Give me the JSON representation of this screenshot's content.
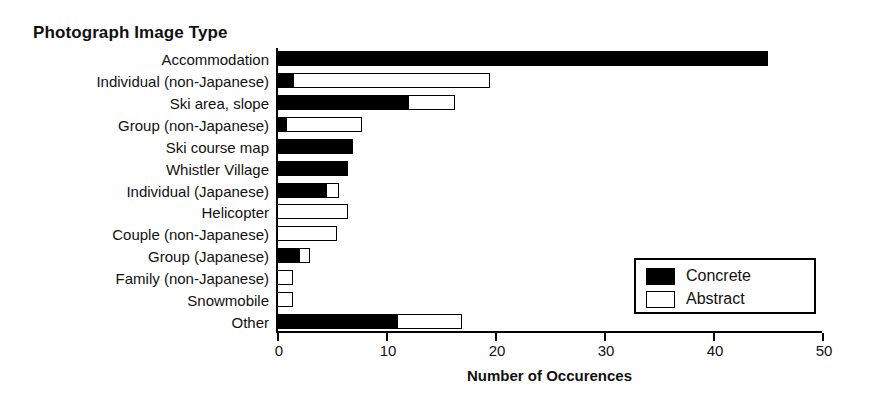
{
  "chart_data": {
    "type": "bar",
    "orientation": "horizontal",
    "stacked": true,
    "title": "Photograph Image Type",
    "xlabel": "Number of Occurences",
    "ylabel": "",
    "xlim": [
      0,
      50
    ],
    "xticks": [
      0,
      10,
      20,
      30,
      40,
      50
    ],
    "xtick_labels": [
      "0",
      "10",
      "20",
      "30",
      "40",
      "50"
    ],
    "grid": false,
    "legend_position": "lower right",
    "categories": [
      "Accommodation",
      "Individual (non-Japanese)",
      "Ski area, slope",
      "Group (non-Japanese)",
      "Ski course map",
      "Whistler Village",
      "Individual (Japanese)",
      "Helicopter",
      "Couple (non-Japanese)",
      "Group (Japanese)",
      "Family (non-Japanese)",
      "Snowmobile",
      "Other"
    ],
    "series": [
      {
        "name": "Concrete",
        "color": "#000000",
        "values": [
          45,
          1.5,
          12,
          0.8,
          7,
          6.5,
          4.5,
          0,
          0,
          2,
          0,
          0,
          11
        ]
      },
      {
        "name": "Abstract",
        "color": "#ffffff",
        "values": [
          0,
          18,
          4.3,
          7,
          0,
          0,
          1.2,
          6.5,
          5.5,
          1,
          1.5,
          1.5,
          6
        ]
      }
    ],
    "totals": [
      45,
      19.5,
      16.3,
      7.8,
      7,
      6.5,
      5.7,
      6.5,
      5.5,
      3,
      1.5,
      1.5,
      17
    ]
  },
  "legend": {
    "items": [
      {
        "label": "Concrete",
        "swatch": "filled-black"
      },
      {
        "label": "Abstract",
        "swatch": "outline-white"
      }
    ]
  }
}
